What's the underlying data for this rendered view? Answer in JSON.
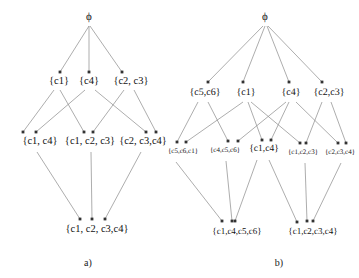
{
  "figure": {
    "type": "hasse-lattice-pair",
    "background": "#ffffff",
    "edge_color": "#8a8a8a",
    "text_color": "#141414",
    "width": 359,
    "height": 278
  },
  "diagrams": [
    {
      "id": "a",
      "caption": "a)",
      "caption_pos": {
        "x": 88,
        "y": 262
      },
      "levels": [
        {
          "name": "level-1-empty-set",
          "nodes": [
            {
              "id": "a-top",
              "label": "ϕ",
              "x": 89,
              "y": 18,
              "cls": "lvl-top"
            }
          ]
        },
        {
          "name": "level-2-singletons",
          "nodes": [
            {
              "id": "a-c1",
              "label": "{c1}",
              "x": 59,
              "y": 82,
              "cls": "lvl-a-2"
            },
            {
              "id": "a-c4",
              "label": "{c4}",
              "x": 89,
              "y": 82,
              "cls": "lvl-a-2"
            },
            {
              "id": "a-c2c3",
              "label": "{c2, c3}",
              "x": 131,
              "y": 82,
              "cls": "lvl-a-2"
            }
          ]
        },
        {
          "name": "level-3-pairs",
          "nodes": [
            {
              "id": "a-c1c4",
              "label": "{c1, c4}",
              "x": 40,
              "y": 142,
              "cls": "lvl-a-3"
            },
            {
              "id": "a-c1c2c3",
              "label": "{c1, c2, c3}",
              "x": 90,
              "y": 142,
              "cls": "lvl-a-3"
            },
            {
              "id": "a-c2c3c4",
              "label": "{c2, c3,c4}",
              "x": 143,
              "y": 142,
              "cls": "lvl-a-3"
            }
          ]
        },
        {
          "name": "level-4-full-set",
          "nodes": [
            {
              "id": "a-all",
              "label": "{c1, c2, c3,c4}",
              "x": 97,
              "y": 230,
              "cls": "lvl-a-4"
            }
          ]
        }
      ],
      "edges": [
        {
          "from": "a-top",
          "to": "a-c1",
          "x1": 89,
          "y1": 26,
          "x2": 60,
          "y2": 72
        },
        {
          "from": "a-top",
          "to": "a-c4",
          "x1": 89,
          "y1": 26,
          "x2": 89,
          "y2": 72
        },
        {
          "from": "a-top",
          "to": "a-c2c3",
          "x1": 90,
          "y1": 26,
          "x2": 122,
          "y2": 72
        },
        {
          "from": "a-c1",
          "to": "a-c1c4",
          "x1": 54,
          "y1": 90,
          "x2": 23,
          "y2": 132
        },
        {
          "from": "a-c1",
          "to": "a-c1c2c3",
          "x1": 60,
          "y1": 90,
          "x2": 84,
          "y2": 132
        },
        {
          "from": "a-c4",
          "to": "a-c1c4",
          "x1": 85,
          "y1": 90,
          "x2": 36,
          "y2": 132
        },
        {
          "from": "a-c4",
          "to": "a-c2c3c4",
          "x1": 95,
          "y1": 90,
          "x2": 146,
          "y2": 132
        },
        {
          "from": "a-c2c3",
          "to": "a-c1c2c3",
          "x1": 124,
          "y1": 90,
          "x2": 93,
          "y2": 132
        },
        {
          "from": "a-c2c3",
          "to": "a-c2c3c4",
          "x1": 134,
          "y1": 90,
          "x2": 156,
          "y2": 132
        },
        {
          "from": "a-c1c4",
          "to": "a-all",
          "x1": 37,
          "y1": 152,
          "x2": 80,
          "y2": 219
        },
        {
          "from": "a-c1c2c3",
          "to": "a-all",
          "x1": 91,
          "y1": 152,
          "x2": 92,
          "y2": 219
        },
        {
          "from": "a-c2c3c4",
          "to": "a-all",
          "x1": 141,
          "y1": 152,
          "x2": 105,
          "y2": 219
        }
      ]
    },
    {
      "id": "b",
      "caption": "b)",
      "caption_pos": {
        "x": 279,
        "y": 262
      },
      "levels": [
        {
          "name": "level-1-empty-set",
          "nodes": [
            {
              "id": "b-top",
              "label": "ϕ",
              "x": 265,
              "y": 18,
              "cls": "lvl-top"
            }
          ]
        },
        {
          "name": "level-2-base-sets",
          "nodes": [
            {
              "id": "b-c5c6",
              "label": "{c5,c6}",
              "x": 205,
              "y": 93,
              "cls": "lvl-b-2"
            },
            {
              "id": "b-c1",
              "label": "{c1}",
              "x": 246,
              "y": 93,
              "cls": "lvl-b-2"
            },
            {
              "id": "b-c4",
              "label": "{c4}",
              "x": 291,
              "y": 93,
              "cls": "lvl-b-2"
            },
            {
              "id": "b-c2c3",
              "label": "{c2,c3}",
              "x": 329,
              "y": 93,
              "cls": "lvl-b-2"
            }
          ]
        },
        {
          "name": "level-3-joins",
          "nodes": [
            {
              "id": "b-c5c6c1",
              "label": "{c5,c6,c1}",
              "x": 183,
              "y": 152,
              "cls": "lvl-b-3"
            },
            {
              "id": "b-c4c5c6",
              "label": "{c4,c5,c6}",
              "x": 225,
              "y": 151,
              "cls": "lvl-b-3"
            },
            {
              "id": "b-c1c4",
              "label": "{c1,c4}",
              "x": 264,
              "y": 150,
              "cls": "lvl-b-3-big"
            },
            {
              "id": "b-c1c2c3",
              "label": "{c1,c2,c3}",
              "x": 303,
              "y": 153,
              "cls": "lvl-b-3"
            },
            {
              "id": "b-c2c3c4",
              "label": "{c2,c3,c4}",
              "x": 340,
              "y": 153,
              "cls": "lvl-b-3"
            }
          ]
        },
        {
          "name": "level-4-tops",
          "nodes": [
            {
              "id": "b-c1c4c5c6",
              "label": "{c1,c4,c5,c6}",
              "x": 237,
              "y": 232,
              "cls": "lvl-b-4"
            },
            {
              "id": "b-c1c2c3c4",
              "label": "{c1,c2,c3,c4}",
              "x": 313,
              "y": 232,
              "cls": "lvl-b-4"
            }
          ]
        }
      ],
      "edges": [
        {
          "from": "b-top",
          "to": "b-c5c6",
          "x1": 263,
          "y1": 26,
          "x2": 208,
          "y2": 82
        },
        {
          "from": "b-top",
          "to": "b-c1",
          "x1": 265,
          "y1": 26,
          "x2": 243,
          "y2": 82
        },
        {
          "from": "b-top",
          "to": "b-c4",
          "x1": 267,
          "y1": 26,
          "x2": 289,
          "y2": 82
        },
        {
          "from": "b-top",
          "to": "b-c2c3",
          "x1": 268,
          "y1": 26,
          "x2": 322,
          "y2": 82
        },
        {
          "from": "b-c5c6",
          "to": "b-c5c6c1",
          "x1": 198,
          "y1": 102,
          "x2": 177,
          "y2": 142
        },
        {
          "from": "b-c5c6",
          "to": "b-c4c5c6",
          "x1": 208,
          "y1": 102,
          "x2": 228,
          "y2": 141
        },
        {
          "from": "b-c1",
          "to": "b-c5c6c1",
          "x1": 243,
          "y1": 102,
          "x2": 186,
          "y2": 142
        },
        {
          "from": "b-c1",
          "to": "b-c1c4",
          "x1": 248,
          "y1": 102,
          "x2": 262,
          "y2": 140
        },
        {
          "from": "b-c1",
          "to": "b-c1c2c3",
          "x1": 251,
          "y1": 102,
          "x2": 300,
          "y2": 143
        },
        {
          "from": "b-c4",
          "to": "b-c4c5c6",
          "x1": 286,
          "y1": 102,
          "x2": 238,
          "y2": 141
        },
        {
          "from": "b-c4",
          "to": "b-c1c4",
          "x1": 289,
          "y1": 102,
          "x2": 271,
          "y2": 140
        },
        {
          "from": "b-c4",
          "to": "b-c2c3c4",
          "x1": 296,
          "y1": 102,
          "x2": 338,
          "y2": 143
        },
        {
          "from": "b-c2c3",
          "to": "b-c1c2c3",
          "x1": 322,
          "y1": 102,
          "x2": 306,
          "y2": 143
        },
        {
          "from": "b-c2c3",
          "to": "b-c2c3c4",
          "x1": 331,
          "y1": 102,
          "x2": 346,
          "y2": 143
        },
        {
          "from": "b-c5c6c1",
          "to": "b-c1c4c5c6",
          "x1": 176,
          "y1": 162,
          "x2": 222,
          "y2": 221
        },
        {
          "from": "b-c4c5c6",
          "to": "b-c1c4c5c6",
          "x1": 226,
          "y1": 161,
          "x2": 232,
          "y2": 221
        },
        {
          "from": "b-c1c4",
          "to": "b-c1c4c5c6",
          "x1": 257,
          "y1": 160,
          "x2": 235,
          "y2": 221
        },
        {
          "from": "b-c1c4",
          "to": "b-c1c2c3c4",
          "x1": 269,
          "y1": 160,
          "x2": 297,
          "y2": 222
        },
        {
          "from": "b-c1c2c3",
          "to": "b-c1c2c3c4",
          "x1": 305,
          "y1": 163,
          "x2": 307,
          "y2": 221
        },
        {
          "from": "b-c2c3c4",
          "to": "b-c1c2c3c4",
          "x1": 341,
          "y1": 163,
          "x2": 313,
          "y2": 221
        }
      ]
    }
  ]
}
